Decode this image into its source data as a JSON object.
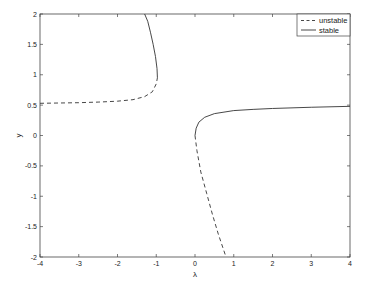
{
  "chart_data": {
    "type": "line",
    "title": "",
    "xlabel": "λ",
    "ylabel": "y",
    "xlim": [
      -4,
      4
    ],
    "ylim": [
      -2,
      2
    ],
    "grid": false,
    "legend_position": "upper right",
    "xticks": [
      -4,
      -3,
      -2,
      -1,
      0,
      1,
      2,
      3,
      4
    ],
    "yticks": [
      -2,
      -1.5,
      -1,
      -0.5,
      0,
      0.5,
      1,
      1.5,
      2
    ],
    "xtick_labels": [
      "-4",
      "-3",
      "-2",
      "-1",
      "0",
      "1",
      "2",
      "3",
      "4"
    ],
    "ytick_labels": [
      "-2",
      "-1.5",
      "-1",
      "-0.5",
      "0",
      "0.5",
      "1",
      "1.5",
      "2"
    ],
    "series": [
      {
        "name": "unstable",
        "style": "dashed",
        "segments": [
          {
            "x": [
              -4.0,
              -3.5,
              -3.0,
              -2.5,
              -2.0,
              -1.6,
              -1.3,
              -1.1,
              -1.0,
              -0.97
            ],
            "y": [
              0.53,
              0.535,
              0.54,
              0.55,
              0.565,
              0.59,
              0.64,
              0.72,
              0.85,
              0.95
            ]
          },
          {
            "x": [
              0.0,
              0.05,
              0.15,
              0.3,
              0.45,
              0.6,
              0.8
            ],
            "y": [
              0.0,
              -0.25,
              -0.6,
              -0.95,
              -1.3,
              -1.62,
              -2.0
            ]
          }
        ]
      },
      {
        "name": "stable",
        "style": "solid",
        "segments": [
          {
            "x": [
              -0.97,
              -0.98,
              -1.02,
              -1.08,
              -1.15,
              -1.22,
              -1.3
            ],
            "y": [
              0.95,
              1.1,
              1.3,
              1.5,
              1.7,
              1.88,
              2.0
            ]
          },
          {
            "x": [
              0.0,
              0.03,
              0.1,
              0.25,
              0.5,
              1.0,
              1.5,
              2.0,
              3.0,
              4.0
            ],
            "y": [
              0.0,
              0.12,
              0.22,
              0.3,
              0.36,
              0.41,
              0.43,
              0.445,
              0.465,
              0.48
            ]
          }
        ]
      }
    ]
  }
}
